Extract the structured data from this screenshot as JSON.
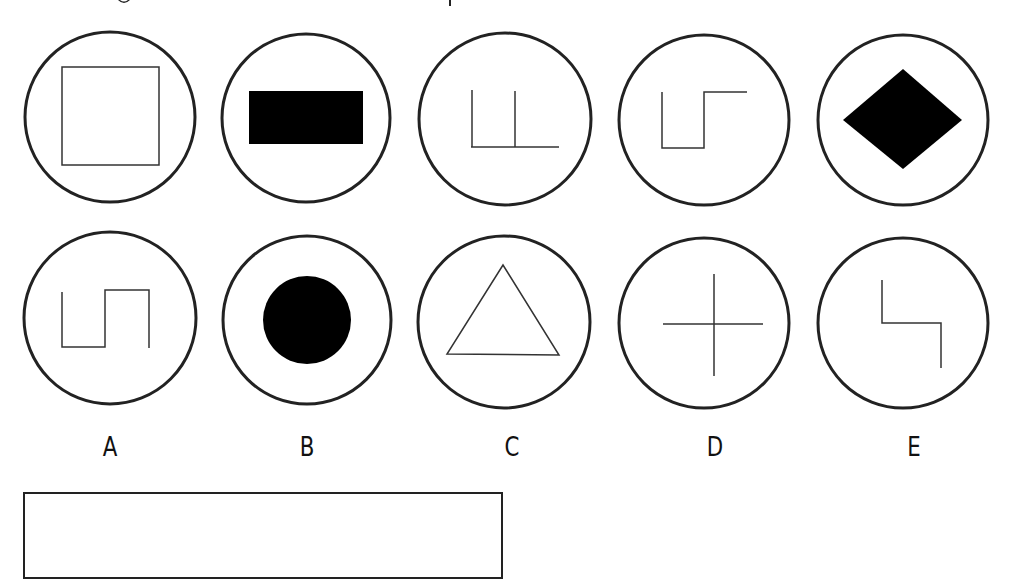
{
  "colors": {
    "stroke": "#222222",
    "fill": "#000000",
    "background": "#ffffff"
  },
  "top_row": [
    {
      "shape": "square-outline",
      "cx": 110,
      "cy": 117,
      "r": 85
    },
    {
      "shape": "filled-rectangle",
      "cx": 306,
      "cy": 118,
      "r": 84
    },
    {
      "shape": "double-stem-l-lines",
      "cx": 505,
      "cy": 119,
      "r": 86
    },
    {
      "shape": "step-line",
      "cx": 704,
      "cy": 120,
      "r": 85
    },
    {
      "shape": "filled-diamond",
      "cx": 903,
      "cy": 120,
      "r": 85
    }
  ],
  "bottom_row": [
    {
      "label": "A",
      "shape": "square-wave-line",
      "cx": 110,
      "cy": 318,
      "r": 86
    },
    {
      "label": "B",
      "shape": "filled-circle",
      "cx": 307,
      "cy": 320,
      "r": 84
    },
    {
      "label": "C",
      "shape": "triangle-outline",
      "cx": 504,
      "cy": 322,
      "r": 86
    },
    {
      "label": "D",
      "shape": "cross-lines",
      "cx": 704,
      "cy": 323,
      "r": 85
    },
    {
      "label": "E",
      "shape": "z-step-line",
      "cx": 903,
      "cy": 323,
      "r": 85
    }
  ],
  "labels": {
    "a": "A",
    "b": "B",
    "c": "C",
    "d": "D",
    "e": "E"
  },
  "answer_box": {
    "value": ""
  }
}
